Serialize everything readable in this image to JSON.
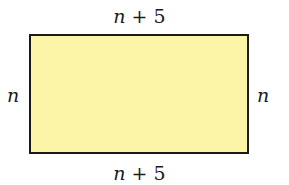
{
  "diagram": {
    "shape": "rectangle",
    "fill_color": "#fcf5a8",
    "stroke_color": "#1a1a1a",
    "labels": {
      "top": {
        "var": "n",
        "rest": " + 5"
      },
      "bottom": {
        "var": "n",
        "rest": " + 5"
      },
      "left": {
        "var": "n"
      },
      "right": {
        "var": "n"
      }
    }
  }
}
